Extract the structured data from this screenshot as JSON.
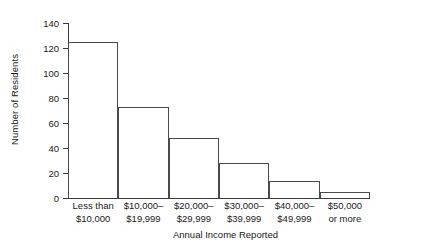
{
  "chart_data": {
    "type": "bar",
    "title": "",
    "xlabel": "Annual Income Reported",
    "ylabel": "Number of Residents",
    "categories": [
      "Less than\n$10,000",
      "$10,000–\n$19,999",
      "$20,000–\n$29,999",
      "$30,000–\n$39,999",
      "$40,000–\n$49,999",
      "$50,000\nor more"
    ],
    "category_lines": [
      [
        "Less than",
        "$10,000"
      ],
      [
        "$10,000–",
        "$19,999"
      ],
      [
        "$20,000–",
        "$29,999"
      ],
      [
        "$30,000–",
        "$39,999"
      ],
      [
        "$40,000–",
        "$49,999"
      ],
      [
        "$50,000",
        "or more"
      ]
    ],
    "values": [
      125,
      73,
      48,
      28,
      14,
      5
    ],
    "ylim": [
      0,
      140
    ],
    "ytick_step": 20,
    "yticks": [
      0,
      20,
      40,
      60,
      80,
      100,
      120,
      140
    ],
    "ytick_labels": [
      "0",
      "20",
      "40",
      "60",
      "80",
      "100",
      "120",
      "140"
    ],
    "grid": false,
    "legend": "none",
    "bar_style": "histogram-adjacent",
    "colors": {
      "bar_fill": "#ffffff",
      "bar_stroke": "#4a4a4a",
      "axis": "#3c3c3c",
      "text": "#1a1a1a",
      "background": "#ffffff"
    }
  }
}
